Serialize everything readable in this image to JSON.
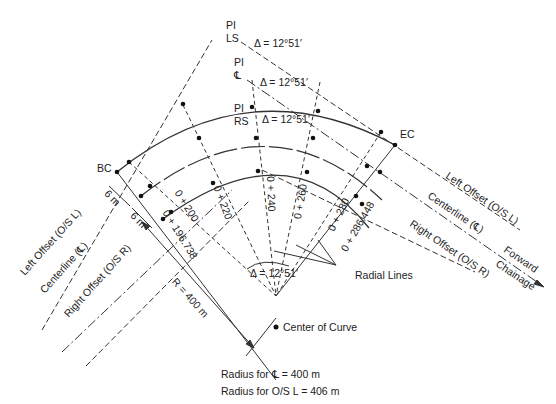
{
  "labels": {
    "pi_ls": [
      "PI",
      "LS"
    ],
    "pi_cl": [
      "PI",
      "℄"
    ],
    "pi_rs": [
      "PI",
      "RS"
    ],
    "delta": "Δ = 12°51′",
    "bc": "BC",
    "ec": "EC",
    "offset_6m_1": "6 m",
    "offset_6m_2": "6 m",
    "left_offset": "Left Offset (O/S L)",
    "centerline": "Centerline (℄)",
    "right_offset": "Right Offset (O/S R)",
    "radius": "R = 400 m",
    "forward_chainage": [
      "Forward",
      "Chainage"
    ],
    "radial_lines": "Radial Lines",
    "center_of_curve": "Center of Curve",
    "radius_cl": "Radius for ℄ = 400 m",
    "radius_osl": "Radius for O/S L = 406 m"
  },
  "stations": [
    "0 + 196.738",
    "0 + 200",
    "0 + 220",
    "0 + 240",
    "0 + 260",
    "0 + 280",
    "0 + 286.448"
  ]
}
